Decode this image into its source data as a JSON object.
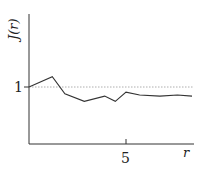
{
  "chart_data": {
    "type": "line",
    "title": "",
    "xlabel": "r",
    "ylabel": "J(r)",
    "x_ticks": [
      "5"
    ],
    "y_ticks": [
      "1"
    ],
    "reference_line": {
      "y": 1,
      "style": "dotted"
    },
    "xlim": [
      0,
      8.6
    ],
    "ylim": [
      0,
      1.9
    ],
    "grid": false,
    "series": [
      {
        "name": "J(r)",
        "x": [
          0,
          1.2,
          1.85,
          2.85,
          3.9,
          4.45,
          5.0,
          5.7,
          6.75,
          7.65,
          8.4
        ],
        "y": [
          1.0,
          1.18,
          0.88,
          0.75,
          0.84,
          0.75,
          0.91,
          0.86,
          0.84,
          0.86,
          0.84
        ]
      }
    ]
  }
}
